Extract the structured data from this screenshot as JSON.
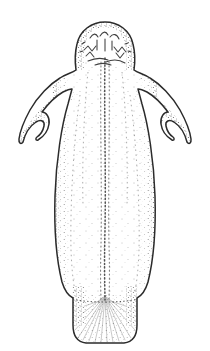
{
  "figure": {
    "title": "Specimen line illustration",
    "subject_name": "bilaterally-symmetric-marine-invertebrate",
    "technique": "stipple-and-line-drawing",
    "view": "dorsal",
    "background_color": "#ffffff",
    "ink_color": "#3a3a3a",
    "outline_color": "#2b2b2b",
    "stipple_color": "#4a4a4a",
    "canvas": {
      "width": 210,
      "height": 351
    },
    "body_parts": [
      {
        "id": "head",
        "label": "head",
        "description": "rounded anterior dome with squiggly surface markings",
        "bbox": [
          75,
          22,
          60,
          45
        ]
      },
      {
        "id": "left-arm",
        "label": "left arm",
        "description": "tapering lateral appendage curving downward to a hooked tip",
        "bbox": [
          18,
          74,
          50,
          70
        ]
      },
      {
        "id": "right-arm",
        "label": "right arm",
        "description": "tapering lateral appendage curving downward to a hooked tip",
        "bbox": [
          142,
          74,
          50,
          70
        ]
      },
      {
        "id": "trunk",
        "label": "trunk",
        "description": "elongate column widening at mid-body then tapering",
        "bbox": [
          52,
          66,
          106,
          225
        ]
      },
      {
        "id": "midline",
        "label": "midline",
        "description": "dotted longitudinal axial line running head to base",
        "bbox": [
          100,
          58,
          10,
          265
        ]
      },
      {
        "id": "pedal-disc",
        "label": "pedal disc",
        "description": "rounded rectangular basal attachment organ with radiating striations",
        "bbox": [
          73,
          290,
          64,
          54
        ]
      }
    ],
    "annotations": []
  }
}
